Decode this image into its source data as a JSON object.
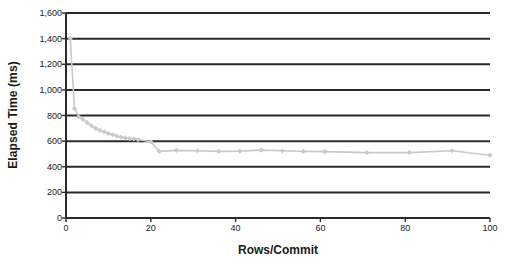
{
  "chart_data": {
    "type": "line",
    "title": "",
    "xlabel": "Rows/Commit",
    "ylabel": "Elapsed Time (ms)",
    "xlim": [
      0,
      100
    ],
    "ylim": [
      0,
      1600
    ],
    "xticks": [
      0,
      20,
      40,
      60,
      80,
      100
    ],
    "yticks": [
      0,
      200,
      400,
      600,
      800,
      1000,
      1200,
      1400,
      1600
    ],
    "ytick_labels": [
      "0",
      "200",
      "400",
      "600",
      "800",
      "1,000",
      "1,200",
      "1,400",
      "1,600"
    ],
    "xtick_labels": [
      "0",
      "20",
      "40",
      "60",
      "80",
      "100"
    ],
    "grid": "horizontal",
    "legend": "none",
    "series": [
      {
        "name": "Elapsed Time",
        "color": "#c9c9c9",
        "marker": "diamond",
        "x": [
          1,
          2,
          3,
          4,
          5,
          6,
          7,
          8,
          9,
          10,
          11,
          12,
          13,
          14,
          15,
          16,
          17,
          20,
          22,
          26,
          31,
          36,
          41,
          46,
          51,
          56,
          61,
          71,
          81,
          91,
          100
        ],
        "y": [
          1400,
          855,
          790,
          770,
          745,
          720,
          700,
          685,
          672,
          660,
          650,
          640,
          632,
          625,
          620,
          618,
          612,
          595,
          520,
          528,
          525,
          520,
          522,
          530,
          525,
          520,
          518,
          510,
          510,
          525,
          490
        ]
      }
    ]
  },
  "axis": {
    "y_title": "Elapsed Time (ms)",
    "x_title": "Rows/Commit"
  }
}
